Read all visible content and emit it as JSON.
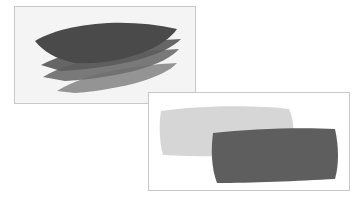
{
  "images": [
    {
      "name": "layered-leaf-strokes",
      "description": "Stacked watercolor leaf shapes in graded grays",
      "layers": [
        {
          "shade": "#8a8a8a"
        },
        {
          "shade": "#6e6e6e"
        },
        {
          "shade": "#5c5c5c"
        },
        {
          "shade": "#4a4a4a"
        }
      ]
    },
    {
      "name": "overlapping-paint-swatches",
      "description": "Light gray brush swatch overlapped by a dark gray brush swatch",
      "swatches": [
        {
          "shade": "#d6d6d6"
        },
        {
          "shade": "#5e5e5e"
        }
      ]
    }
  ]
}
